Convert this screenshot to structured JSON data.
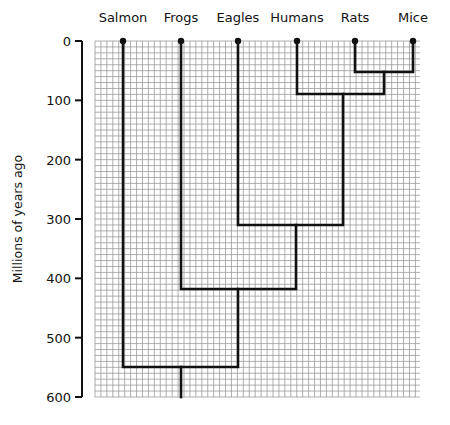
{
  "chart_data": {
    "type": "phylogenetic-tree",
    "ylabel": "Millions of years ago",
    "y_ticks": [
      0,
      100,
      200,
      300,
      400,
      500,
      600
    ],
    "ylim": [
      0,
      600
    ],
    "grid": true,
    "taxa": [
      "Salmon",
      "Frogs",
      "Eagles",
      "Humans",
      "Rats",
      "Mice"
    ],
    "divergences": [
      {
        "groups": [
          "Rats",
          "Mice"
        ],
        "mya": 50
      },
      {
        "groups": [
          "Humans",
          "Rats+Mice"
        ],
        "mya": 90
      },
      {
        "groups": [
          "Eagles",
          "Humans+Rats+Mice"
        ],
        "mya": 310
      },
      {
        "groups": [
          "Frogs",
          "Eagles+Humans+Rats+Mice"
        ],
        "mya": 420
      },
      {
        "groups": [
          "Salmon",
          "Frogs+Eagles+Humans+Rats+Mice"
        ],
        "mya": 550
      }
    ],
    "root_mya": 600
  },
  "labels": {
    "ylabel": "Millions of years ago",
    "ticks": [
      "0",
      "100",
      "200",
      "300",
      "400",
      "500",
      "600"
    ],
    "taxa": [
      "Salmon",
      "Frogs",
      "Eagles",
      "Humans",
      "Rats",
      "Mice"
    ]
  }
}
